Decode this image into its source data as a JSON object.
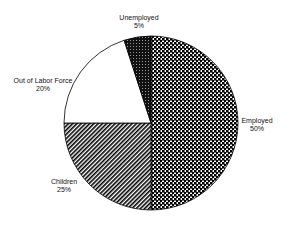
{
  "chart_data": {
    "type": "pie",
    "title": "",
    "categories": [
      "Employed",
      "Children",
      "Out of Labor Force",
      "Unemployed"
    ],
    "values": [
      50,
      25,
      20,
      5
    ],
    "value_labels": [
      "50%",
      "25%",
      "20%",
      "5%"
    ],
    "start_angle_deg": 0,
    "direction": "clockwise from 12 o'clock",
    "fills": [
      "checkerboard",
      "diagonal-hatch",
      "white",
      "dark-dotted"
    ],
    "legend": "none (data labels outside slices)"
  },
  "labels": {
    "employed": {
      "name": "Employed",
      "pct": "50%"
    },
    "children": {
      "name": "Children",
      "pct": "25%"
    },
    "out_of_labor_force": {
      "name": "Out of Labor Force",
      "pct": "20%"
    },
    "unemployed": {
      "name": "Unemployed",
      "pct": "5%"
    }
  }
}
